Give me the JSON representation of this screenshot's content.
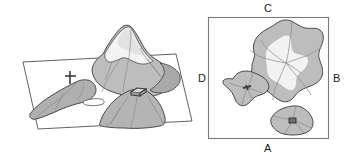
{
  "figure": {
    "title": "",
    "panels": [
      {
        "id": "perspective-view",
        "name": "3d-perspective-landform-view",
        "description": "Oblique 3D view of a mountain massif resting on a ground plane",
        "ground_plane": "trapezoid",
        "markers": [
          {
            "id": "cross-marker",
            "symbol": "+",
            "view_x": 70,
            "view_y": 77
          },
          {
            "id": "rectangle-marker",
            "symbol": "rectangle",
            "view_x": 138,
            "view_y": 92
          }
        ]
      },
      {
        "id": "plan-view",
        "name": "2d-plan-map-view",
        "description": "Square map frame containing three landform outlines seen from above",
        "frame": {
          "x": 208,
          "y": 17,
          "width": 120,
          "height": 122
        },
        "edge_labels": {
          "top": "C",
          "right": "B",
          "bottom": "A",
          "left": "D"
        },
        "landforms": [
          {
            "id": "large-massif",
            "markers": []
          },
          {
            "id": "west-ridge",
            "markers": [
              {
                "id": "cross-marker",
                "symbol": "+"
              }
            ]
          },
          {
            "id": "south-hill",
            "markers": [
              {
                "id": "rectangle-marker",
                "symbol": "rectangle"
              }
            ]
          }
        ]
      }
    ]
  },
  "colors": {
    "outline": "#3a3a3a",
    "slope_dark": "#a8a8a8",
    "slope_mid": "#bdbdbd",
    "slope_light": "#d2d2d2",
    "snow": "#f2f2f2",
    "marker": "#3d3d3d",
    "frame": "#6b6b6b",
    "background": "#ffffff",
    "label_text": "#1a1a1a"
  },
  "labels": {
    "a": "A",
    "b": "B",
    "c": "C",
    "d": "D"
  }
}
